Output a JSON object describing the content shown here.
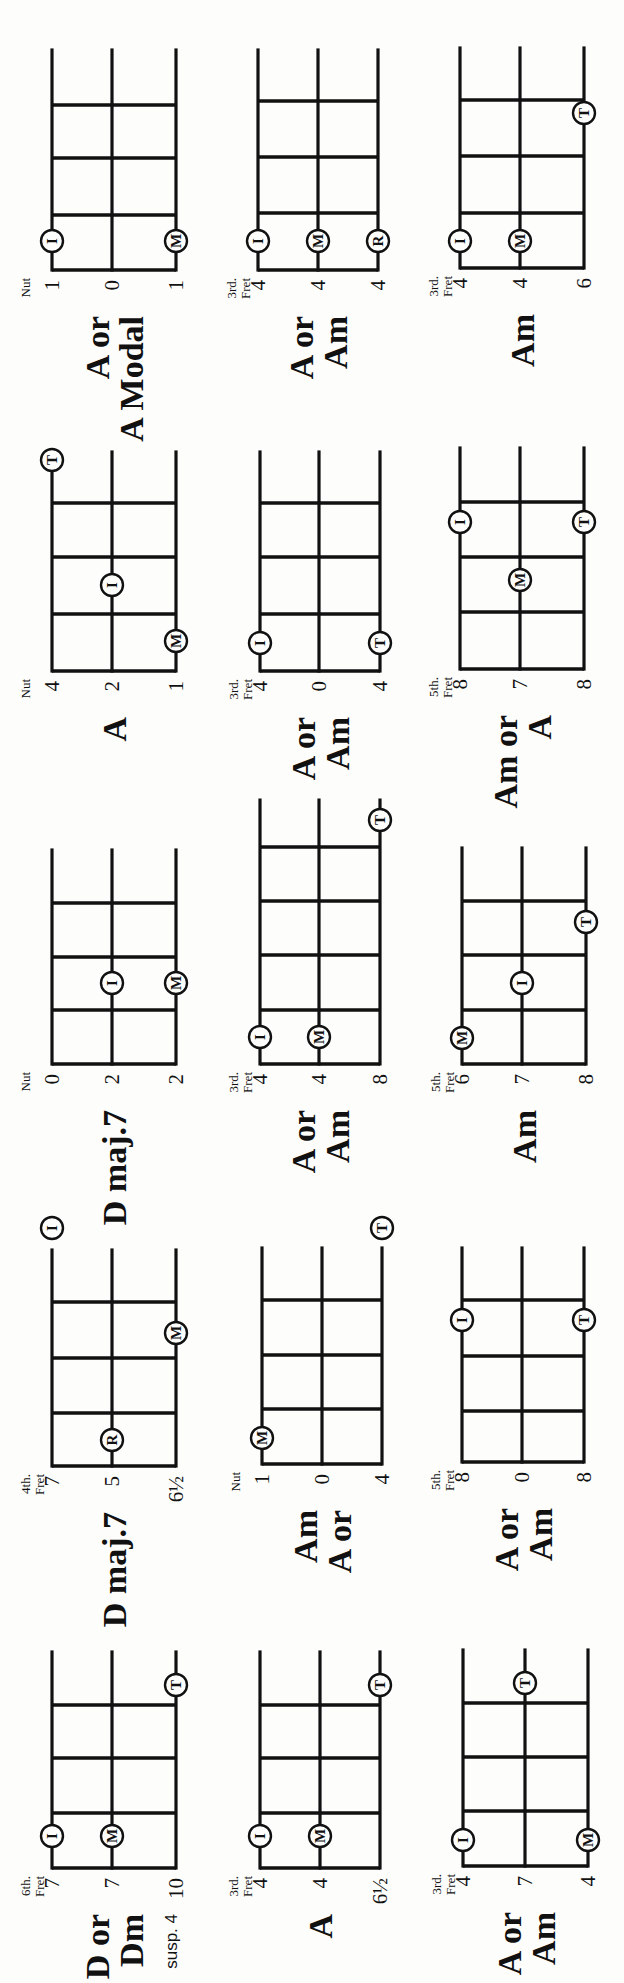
{
  "page": {
    "width": 1983,
    "height": 624,
    "orientation": "rotated-90-ccw",
    "ink_color": "#111111",
    "paper_color": "#fdfdfc"
  },
  "legend": {
    "I": "index finger",
    "M": "middle finger",
    "R": "ring finger",
    "T": "thumb"
  },
  "diagrams": [
    {
      "id": "r1c1",
      "name_lines": [
        "D or",
        "Dm"
      ],
      "sub": "susp. 4",
      "position_label": [
        "6th.",
        "Fret"
      ],
      "strings_y": [
        52,
        112,
        176
      ],
      "base_x": 115,
      "frets_x": [
        170,
        225,
        278
      ],
      "end_x": 331,
      "string_numbers": [
        "7",
        "7",
        "10"
      ],
      "dots": [
        {
          "finger": "I",
          "string": 0,
          "x": 147
        },
        {
          "finger": "M",
          "string": 1,
          "x": 147
        },
        {
          "finger": "T",
          "string": 2,
          "x": 298
        }
      ]
    },
    {
      "id": "r1c2",
      "name_lines": [
        "A"
      ],
      "sub": "",
      "position_label": [
        "3rd.",
        "Fret"
      ],
      "strings_y": [
        260,
        320,
        380
      ],
      "base_x": 115,
      "frets_x": [
        170,
        225,
        278
      ],
      "end_x": 331,
      "string_numbers": [
        "4",
        "4",
        "6½"
      ],
      "dots": [
        {
          "finger": "I",
          "string": 0,
          "x": 147
        },
        {
          "finger": "M",
          "string": 1,
          "x": 147
        },
        {
          "finger": "T",
          "string": 2,
          "x": 298
        }
      ]
    },
    {
      "id": "r1c3",
      "name_lines": [
        "A or",
        "Am"
      ],
      "sub": "",
      "position_label": [
        "3rd.",
        "Fret"
      ],
      "strings_y": [
        463,
        525,
        588
      ],
      "base_x": 117,
      "frets_x": [
        172,
        226,
        280
      ],
      "end_x": 333,
      "string_numbers": [
        "4",
        "7",
        "4"
      ],
      "dots": [
        {
          "finger": "I",
          "string": 0,
          "x": 143
        },
        {
          "finger": "M",
          "string": 2,
          "x": 143
        },
        {
          "finger": "T",
          "string": 1,
          "x": 300
        }
      ]
    },
    {
      "id": "r2c1",
      "name_lines": [
        "D maj.7"
      ],
      "sub": "",
      "position_label": [
        "4th.",
        "Fret"
      ],
      "strings_y": [
        52,
        112,
        176
      ],
      "base_x": 517,
      "frets_x": [
        570,
        625,
        681
      ],
      "end_x": 733,
      "string_numbers": [
        "7",
        "5",
        "6½"
      ],
      "dots": [
        {
          "finger": "R",
          "string": 1,
          "x": 543
        },
        {
          "finger": "M",
          "string": 2,
          "x": 650
        },
        {
          "finger": "I",
          "string": 0,
          "x": 755
        }
      ]
    },
    {
      "id": "r2c2",
      "name_lines": [
        "Am",
        "A or"
      ],
      "sub": "",
      "position_label": [
        "Nut",
        ""
      ],
      "strings_y": [
        262,
        322,
        382
      ],
      "base_x": 519,
      "frets_x": [
        574,
        628,
        683
      ],
      "end_x": 735,
      "string_numbers": [
        "1",
        "0",
        "4"
      ],
      "dots": [
        {
          "finger": "M",
          "string": 0,
          "x": 545
        },
        {
          "finger": "T",
          "string": 2,
          "x": 755
        }
      ]
    },
    {
      "id": "r2c3",
      "name_lines": [
        "A or",
        "Am"
      ],
      "sub": "",
      "position_label": [
        "5th.",
        "Fret"
      ],
      "strings_y": [
        462,
        522,
        584
      ],
      "base_x": 521,
      "frets_x": [
        572,
        627,
        683
      ],
      "end_x": 735,
      "string_numbers": [
        "8",
        "0",
        "8"
      ],
      "dots": [
        {
          "finger": "I",
          "string": 0,
          "x": 663
        },
        {
          "finger": "T",
          "string": 2,
          "x": 663
        }
      ]
    },
    {
      "id": "r3c1",
      "name_lines": [
        "D maj.7"
      ],
      "sub": "",
      "position_label": [
        "Nut",
        ""
      ],
      "strings_y": [
        52,
        112,
        176
      ],
      "base_x": 919,
      "frets_x": [
        973,
        1026,
        1080
      ],
      "end_x": 1133,
      "string_numbers": [
        "0",
        "2",
        "2"
      ],
      "dots": [
        {
          "finger": "I",
          "string": 1,
          "x": 1000
        },
        {
          "finger": "M",
          "string": 2,
          "x": 1000
        }
      ]
    },
    {
      "id": "r3c2",
      "name_lines": [
        "A or",
        "Am"
      ],
      "sub": "",
      "position_label": [
        "3rd.",
        "Fret"
      ],
      "strings_y": [
        260,
        319,
        380
      ],
      "base_x": 919,
      "frets_x": [
        973,
        1028,
        1082,
        1136
      ],
      "end_x": 1183,
      "string_numbers": [
        "4",
        "4",
        "8"
      ],
      "dots": [
        {
          "finger": "I",
          "string": 0,
          "x": 946
        },
        {
          "finger": "M",
          "string": 1,
          "x": 946
        },
        {
          "finger": "T",
          "string": 2,
          "x": 1163
        }
      ]
    },
    {
      "id": "r3c3",
      "name_lines": [
        "Am"
      ],
      "sub": "",
      "position_label": [
        "5th.",
        "Fret"
      ],
      "strings_y": [
        462,
        522,
        586
      ],
      "base_x": 919,
      "frets_x": [
        973,
        1028,
        1082
      ],
      "end_x": 1135,
      "string_numbers": [
        "6",
        "7",
        "8"
      ],
      "dots": [
        {
          "finger": "M",
          "string": 0,
          "x": 945
        },
        {
          "finger": "I",
          "string": 1,
          "x": 1000
        },
        {
          "finger": "T",
          "string": 2,
          "x": 1061
        }
      ]
    },
    {
      "id": "r4c1",
      "name_lines": [
        "A"
      ],
      "sub": "",
      "position_label": [
        "Nut",
        ""
      ],
      "strings_y": [
        52,
        112,
        176
      ],
      "base_x": 1312,
      "frets_x": [
        1369,
        1426,
        1480
      ],
      "end_x": 1531,
      "string_numbers": [
        "4",
        "2",
        "1"
      ],
      "dots": [
        {
          "finger": "M",
          "string": 2,
          "x": 1342
        },
        {
          "finger": "I",
          "string": 1,
          "x": 1398
        },
        {
          "finger": "T",
          "string": 0,
          "x": 1523
        }
      ]
    },
    {
      "id": "r4c2",
      "name_lines": [
        "A or",
        "Am"
      ],
      "sub": "",
      "position_label": [
        "3rd.",
        "Fret"
      ],
      "strings_y": [
        260,
        319,
        380
      ],
      "base_x": 1312,
      "frets_x": [
        1369,
        1426,
        1480
      ],
      "end_x": 1531,
      "string_numbers": [
        "4",
        "0",
        "4"
      ],
      "dots": [
        {
          "finger": "I",
          "string": 0,
          "x": 1340
        },
        {
          "finger": "T",
          "string": 2,
          "x": 1340
        }
      ]
    },
    {
      "id": "r4c3",
      "name_lines": [
        "Am or",
        "A"
      ],
      "sub": "",
      "position_label": [
        "5th.",
        "Fret"
      ],
      "strings_y": [
        460,
        520,
        584
      ],
      "base_x": 1314,
      "frets_x": [
        1371,
        1426,
        1481
      ],
      "end_x": 1535,
      "string_numbers": [
        "8",
        "7",
        "8"
      ],
      "dots": [
        {
          "finger": "M",
          "string": 1,
          "x": 1403
        },
        {
          "finger": "I",
          "string": 0,
          "x": 1461
        },
        {
          "finger": "T",
          "string": 2,
          "x": 1461
        }
      ]
    },
    {
      "id": "r5c1",
      "name_lines": [
        "A or",
        "A Modal"
      ],
      "sub": "",
      "position_label": [
        "Nut",
        ""
      ],
      "strings_y": [
        52,
        112,
        176
      ],
      "base_x": 1713,
      "frets_x": [
        1768,
        1825,
        1878
      ],
      "end_x": 1933,
      "string_numbers": [
        "1",
        "0",
        "1"
      ],
      "dots": [
        {
          "finger": "I",
          "string": 0,
          "x": 1742
        },
        {
          "finger": "M",
          "string": 2,
          "x": 1742
        }
      ]
    },
    {
      "id": "r5c2",
      "name_lines": [
        "A or",
        "Am"
      ],
      "sub": "",
      "position_label": [
        "3rd.",
        "Fret"
      ],
      "strings_y": [
        258,
        318,
        378
      ],
      "base_x": 1713,
      "frets_x": [
        1770,
        1826,
        1882
      ],
      "end_x": 1933,
      "string_numbers": [
        "4",
        "4",
        "4"
      ],
      "dots": [
        {
          "finger": "I",
          "string": 0,
          "x": 1742
        },
        {
          "finger": "M",
          "string": 1,
          "x": 1742
        },
        {
          "finger": "R",
          "string": 2,
          "x": 1742
        }
      ]
    },
    {
      "id": "r5c3",
      "name_lines": [
        "Am"
      ],
      "sub": "",
      "position_label": [
        "3rd.",
        "Fret"
      ],
      "strings_y": [
        460,
        520,
        584
      ],
      "base_x": 1715,
      "frets_x": [
        1770,
        1827,
        1883
      ],
      "end_x": 1935,
      "string_numbers": [
        "4",
        "4",
        "6"
      ],
      "dots": [
        {
          "finger": "I",
          "string": 0,
          "x": 1742
        },
        {
          "finger": "M",
          "string": 1,
          "x": 1742
        },
        {
          "finger": "T",
          "string": 2,
          "x": 1870
        }
      ]
    }
  ]
}
